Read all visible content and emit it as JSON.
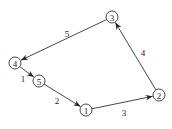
{
  "diagram": {
    "node_radius": 6,
    "nodes": [
      {
        "id": "1",
        "label": "1",
        "x": 86,
        "y": 110
      },
      {
        "id": "2",
        "label": "2",
        "x": 159,
        "y": 95
      },
      {
        "id": "3",
        "label": "3",
        "x": 112,
        "y": 17
      },
      {
        "id": "4",
        "label": "4",
        "x": 15,
        "y": 63
      },
      {
        "id": "5",
        "label": "5",
        "x": 39,
        "y": 81
      }
    ],
    "edges": [
      {
        "from": "4",
        "to": "5",
        "label": "1",
        "lx": 23,
        "ly": 79
      },
      {
        "from": "5",
        "to": "1",
        "label": "2",
        "lx": 57,
        "ly": 101
      },
      {
        "from": "1",
        "to": "2",
        "label": "3",
        "lx": 124,
        "ly": 113
      },
      {
        "from": "2",
        "to": "3",
        "label": "4",
        "lx": 143,
        "ly": 53
      },
      {
        "from": "3",
        "to": "4",
        "label": "5",
        "lx": 67,
        "ly": 34
      }
    ],
    "colors": {
      "stroke": "#333333",
      "text": "#222222",
      "background": "#ffffff"
    }
  }
}
